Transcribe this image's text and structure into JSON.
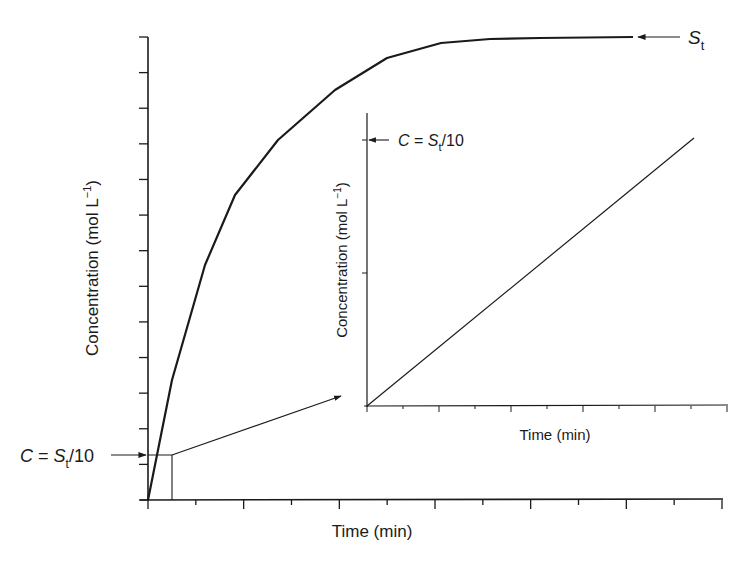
{
  "chart_data": [
    {
      "id": "main",
      "type": "line",
      "title": "",
      "xlabel": "Time (min)",
      "ylabel": "Concentration (mol L⁻¹)",
      "grid": false,
      "legend": null,
      "x_ticks_count": 13,
      "y_ticks_count": 14,
      "tick_labels": "none",
      "series": [
        {
          "name": "concentration",
          "points_px": [
            [
              148,
              500
            ],
            [
              172,
              380
            ],
            [
              205,
              265
            ],
            [
              235,
              195
            ],
            [
              278,
              140
            ],
            [
              335,
              90
            ],
            [
              387,
              58
            ],
            [
              441,
              43
            ],
            [
              490,
              39
            ],
            [
              540,
              38
            ],
            [
              633,
              37
            ]
          ],
          "normalized_x": [
            0,
            0.042,
            0.099,
            0.151,
            0.226,
            0.325,
            0.416,
            0.51,
            0.595,
            0.682,
            0.843
          ],
          "normalized_y": [
            0,
            0.259,
            0.508,
            0.659,
            0.778,
            0.886,
            0.955,
            0.987,
            0.996,
            0.998,
            1.0
          ]
        }
      ],
      "annotations": [
        {
          "label_main": "S",
          "label_sub": "t",
          "meaning": "plateau concentration S_t",
          "arrow": "points left to curve plateau"
        },
        {
          "label_prefix": "C = ",
          "label_var": "S",
          "label_sub": "t",
          "label_suffix": "/10",
          "meaning": "C at 10% of S_t marked on y-axis",
          "arrow": "points right to y-axis"
        }
      ],
      "zoom_box": "small rectangle near origin from C=0 to C=S_t/10, with arrow to inset"
    },
    {
      "id": "inset",
      "type": "line",
      "title": "",
      "xlabel": "Time (min)",
      "ylabel": "Concentration (mol L⁻¹)",
      "grid": false,
      "legend": null,
      "x_ticks_count": 11,
      "y_ticks_count": 2,
      "tick_labels": "none",
      "series": [
        {
          "name": "initial linear region",
          "x": [
            0,
            1
          ],
          "y": [
            0,
            1
          ],
          "note": "straight line from origin to C = S_t/10"
        }
      ],
      "annotations": [
        {
          "label_prefix": "C = ",
          "label_var": "S",
          "label_sub": "t",
          "label_suffix": "/10",
          "arrow": "points left to inset y-axis tick"
        }
      ]
    }
  ],
  "labels": {
    "main_xlabel": "Time (min)",
    "main_ylabel_text": "Concentration (mol L",
    "main_ylabel_sup": "−1",
    "main_ylabel_close": ")",
    "inset_xlabel": "Time (min)",
    "inset_ylabel_text": "Concentration (mol L",
    "inset_ylabel_sup": "−1",
    "inset_ylabel_close": ")",
    "st_main": "S",
    "st_sub": "t",
    "c_prefix": "C",
    "c_eq": " = ",
    "c_var": "S",
    "c_sub": "t",
    "c_suffix": "/10"
  },
  "colors": {
    "ink": "#1a1a1a",
    "background": "#ffffff"
  }
}
